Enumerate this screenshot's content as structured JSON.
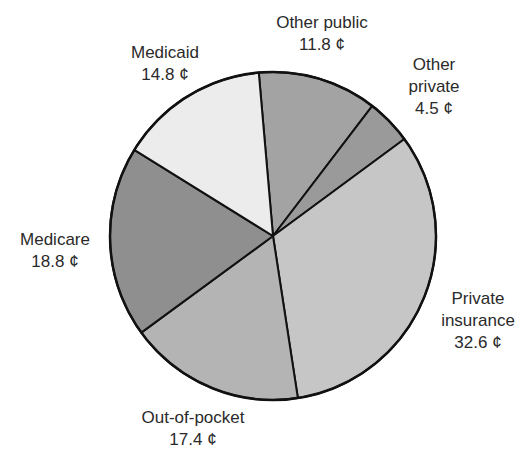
{
  "chart_data": {
    "type": "pie",
    "title": "",
    "unit": "¢",
    "categories": [
      "Other public",
      "Other private",
      "Private insurance",
      "Out-of-pocket",
      "Medicare",
      "Medicaid"
    ],
    "values": [
      11.8,
      4.5,
      32.6,
      17.4,
      18.8,
      14.8
    ],
    "slices": [
      {
        "name": "Other public",
        "value": 11.8,
        "value_label": "11.8 ¢",
        "color": "#a3a3a3"
      },
      {
        "name": "Other private",
        "value": 4.5,
        "value_label": "4.5 ¢",
        "color": "#9a9a9a"
      },
      {
        "name": "Private insurance",
        "value": 32.6,
        "value_label": "32.6 ¢",
        "color": "#c6c6c6"
      },
      {
        "name": "Out-of-pocket",
        "value": 17.4,
        "value_label": "17.4 ¢",
        "color": "#b4b4b4"
      },
      {
        "name": "Medicare",
        "value": 18.8,
        "value_label": "18.8 ¢",
        "color": "#8f8f8f"
      },
      {
        "name": "Medicaid",
        "value": 14.8,
        "value_label": "14.8 ¢",
        "color": "#ececec"
      }
    ],
    "start_angle_deg": -5,
    "direction": "clockwise",
    "legend": "none (direct labels)"
  },
  "labels": {
    "other_public": {
      "line1": "Other public",
      "line2": "11.8 ¢"
    },
    "other_private": {
      "line1": "Other",
      "line2": "private",
      "line3": "4.5 ¢"
    },
    "private_insurance": {
      "line1": "Private",
      "line2": "insurance",
      "line3": "32.6 ¢"
    },
    "out_of_pocket": {
      "line1": "Out-of-pocket",
      "line2": "17.4 ¢"
    },
    "medicare": {
      "line1": "Medicare",
      "line2": "18.8 ¢"
    },
    "medicaid": {
      "line1": "Medicaid",
      "line2": "14.8 ¢"
    }
  }
}
